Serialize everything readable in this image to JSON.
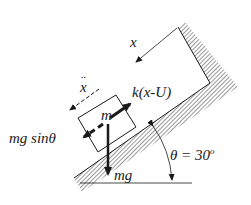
{
  "diagram": {
    "labels": {
      "displacement": "x",
      "acceleration": "x",
      "acceleration_dots": "..",
      "spring_force": "k(x-U)",
      "mass": "m",
      "gravity_component": "mg sinθ",
      "weight": "mg",
      "angle": "θ = 30",
      "angle_degree_mark": "o"
    },
    "angle_deg": 30,
    "colors": {
      "ink": "#1a1a1a",
      "hatch": "#555555",
      "background": "#ffffff"
    }
  }
}
